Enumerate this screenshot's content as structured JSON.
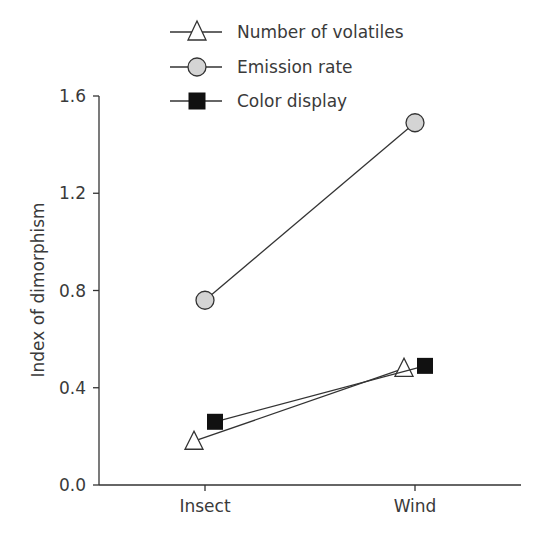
{
  "chart_data": {
    "type": "line",
    "title": "",
    "xlabel": "",
    "ylabel": "Index of dimorphism",
    "categories": [
      "Insect",
      "Wind"
    ],
    "ylim": [
      0.0,
      1.6
    ],
    "yticks": [
      "0.0",
      "0.4",
      "0.8",
      "1.2",
      "1.6"
    ],
    "grid": false,
    "legend_position": "top",
    "series": [
      {
        "name": "Number of volatiles",
        "marker": "triangle-open",
        "values": [
          0.18,
          0.48
        ]
      },
      {
        "name": "Emission rate",
        "marker": "circle-gray",
        "values": [
          0.76,
          1.49
        ]
      },
      {
        "name": "Color display",
        "marker": "square-filled",
        "values": [
          0.26,
          0.49
        ]
      }
    ]
  },
  "colors": {
    "axis": "#333333",
    "text": "#3a3a3a",
    "circle_fill": "#d4d4d4",
    "square_fill": "#111111",
    "triangle_fill": "#ffffff"
  }
}
